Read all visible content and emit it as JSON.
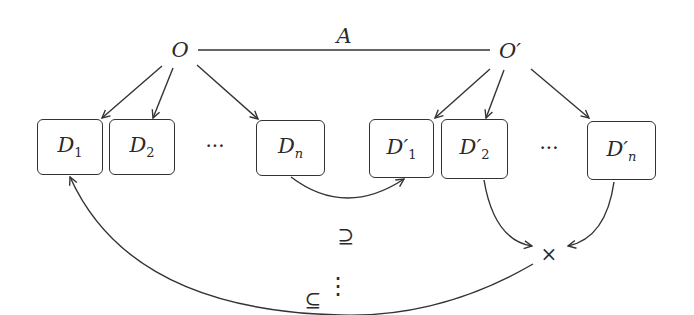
{
  "diagram": {
    "nodes": {
      "O": "O",
      "O_prime": "O′",
      "A_label": "A"
    },
    "left_boxes": [
      {
        "base": "D",
        "sub": "1"
      },
      {
        "base": "D",
        "sub": "2"
      },
      {
        "base": "D",
        "sub": "n"
      }
    ],
    "right_boxes": [
      {
        "base": "D′",
        "sub": "1"
      },
      {
        "base": "D′",
        "sub": "2"
      },
      {
        "base": "D′",
        "sub": "n"
      }
    ],
    "ellipsis_h": "···",
    "ellipsis_v": "⋮",
    "supseteq": "⊇",
    "subseteq": "⊆",
    "times": "×",
    "colors": {
      "stroke": "#333333",
      "text": "#2a2a2a",
      "background": "#ffffff"
    }
  }
}
